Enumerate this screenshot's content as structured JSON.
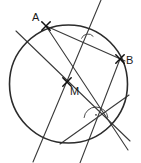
{
  "figure": {
    "kind": "geometry-diagram",
    "width": 141,
    "height": 163,
    "background_color": "#ffffff",
    "stroke_color": "#3a3a3a",
    "circle_stroke_color": "#2b2b2b",
    "label_color": "#1a1a1a"
  },
  "circle": {
    "name": "main-circle",
    "center_x": 68.5,
    "center_y": 84,
    "radius": 59,
    "stroke_width": 1.6
  },
  "points": [
    {
      "id": "A",
      "label": "A",
      "x": 46,
      "y": 26,
      "label_x": 32,
      "label_y": 21,
      "marker": "cross"
    },
    {
      "id": "B",
      "label": "B",
      "x": 120,
      "y": 59,
      "label_x": 126,
      "label_y": 64,
      "marker": "cross"
    },
    {
      "id": "M",
      "label": "M",
      "x": 67,
      "y": 82,
      "label_x": 70,
      "label_y": 95,
      "marker": "cross"
    }
  ],
  "lines": [
    {
      "id": "chord-AB",
      "label": "chord A to B",
      "x1": 46,
      "y1": 26,
      "x2": 125,
      "y2": 61,
      "stroke_width": 1.1
    },
    {
      "id": "line-upper-left-to-lower-right",
      "label": "secant through M from upper left to lower right",
      "x1": 16,
      "y1": 31,
      "x2": 130,
      "y2": 141,
      "stroke_width": 1.1
    },
    {
      "id": "line-A-through-M-to-bottom",
      "label": "line from A through M to lower right",
      "x1": 46,
      "y1": 26,
      "x2": 128,
      "y2": 150,
      "stroke_width": 1.1
    },
    {
      "id": "line-steep-top-to-bottom-left",
      "label": "steep line from top edge to lower left edge",
      "x1": 101,
      "y1": 0,
      "x2": 33,
      "y2": 162,
      "stroke_width": 1.1
    },
    {
      "id": "line-B-down-to-bottom-left",
      "label": "line from B down to lower left of circle",
      "x1": 120,
      "y1": 59,
      "x2": 80,
      "y2": 163,
      "stroke_width": 1.1
    },
    {
      "id": "line-right-to-bottom-left",
      "label": "chord from right side down to bottom left arc",
      "x1": 129,
      "y1": 95,
      "x2": 60,
      "y2": 144,
      "stroke_width": 1.1
    }
  ],
  "angle_marks": [
    {
      "id": "angle-upper",
      "label": "small angle arc near top right intersection",
      "vertex_x": 88,
      "vertex_y": 41,
      "radius": 7,
      "start_angle": 200,
      "end_angle": 320,
      "has_dot": false
    },
    {
      "id": "angle-lower",
      "label": "angle arc with dot near lower right intersection",
      "vertex_x": 96,
      "vertex_y": 119,
      "radius": 12,
      "start_angle": 185,
      "end_angle": 355,
      "has_dot": true
    }
  ]
}
